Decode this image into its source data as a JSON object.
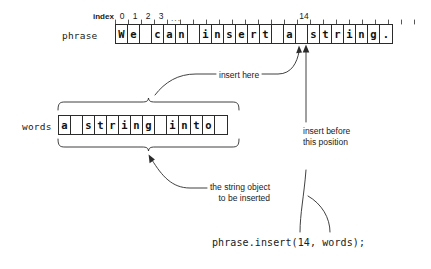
{
  "diagram": {
    "ink_color": "#2b2b2b",
    "background": "#ffffff"
  },
  "index_scale": {
    "label": "index",
    "ticks": [
      {
        "index": 0,
        "label": "0"
      },
      {
        "index": 1,
        "label": "1"
      },
      {
        "index": 2,
        "label": "2"
      },
      {
        "index": 3,
        "label": "3"
      }
    ],
    "ellipsis": "...",
    "highlight": {
      "index": 14,
      "label": "14"
    }
  },
  "phrase": {
    "label": "phrase",
    "text": "We can insert a string.",
    "cells": [
      "W",
      "e",
      " ",
      "c",
      "a",
      "n",
      " ",
      "i",
      "n",
      "s",
      "e",
      "r",
      "t",
      " ",
      "a",
      " ",
      "s",
      "t",
      "r",
      "i",
      "n",
      "g",
      "."
    ]
  },
  "words": {
    "label": "words",
    "text": "a string into ",
    "cells": [
      "a",
      " ",
      "s",
      "t",
      "r",
      "i",
      "n",
      "g",
      " ",
      "i",
      "n",
      "t",
      "o",
      " "
    ]
  },
  "annotations": {
    "insert_here": "insert here",
    "insert_before_line1": "insert before",
    "insert_before_line2": "this position",
    "string_object_line1": "the string object",
    "string_object_line2": "to be inserted"
  },
  "code": {
    "statement": "phrase.insert(14, words);"
  }
}
